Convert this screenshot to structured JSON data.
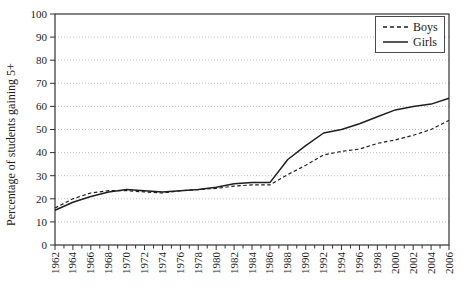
{
  "chart_data": {
    "type": "line",
    "title": "",
    "xlabel": "",
    "ylabel": "Percentage of students gaining 5+",
    "ylim": [
      0,
      100
    ],
    "ytick_step": 10,
    "x_range": [
      1962,
      2006
    ],
    "x_minor_tick_step": 1,
    "grid": "horizontal dotted",
    "legend_position": "top-right",
    "x": [
      1962,
      1964,
      1966,
      1968,
      1970,
      1972,
      1974,
      1976,
      1978,
      1980,
      1982,
      1984,
      1986,
      1988,
      1990,
      1992,
      1994,
      1996,
      1998,
      2000,
      2002,
      2004,
      2006
    ],
    "series": [
      {
        "name": "Boys",
        "line_style": "dashed",
        "values": [
          16,
          20,
          22.5,
          23.5,
          23.5,
          23,
          22.5,
          23.5,
          24,
          24.5,
          25.5,
          26,
          26,
          30.5,
          34.5,
          39,
          40.5,
          41.5,
          44,
          45.5,
          47.5,
          50,
          54
        ]
      },
      {
        "name": "Girls",
        "line_style": "solid",
        "values": [
          15,
          18.5,
          21,
          23,
          24,
          23.5,
          23,
          23.5,
          24,
          25,
          26.5,
          27,
          27,
          37,
          43,
          48.5,
          50,
          52.5,
          55.5,
          58.5,
          60,
          61,
          63.5
        ]
      }
    ]
  },
  "colors": {
    "line": "#1f1f1f",
    "frame": "#333333",
    "grid": "#c2c2c2",
    "text": "#1b1b1b",
    "background": "#ffffff"
  }
}
